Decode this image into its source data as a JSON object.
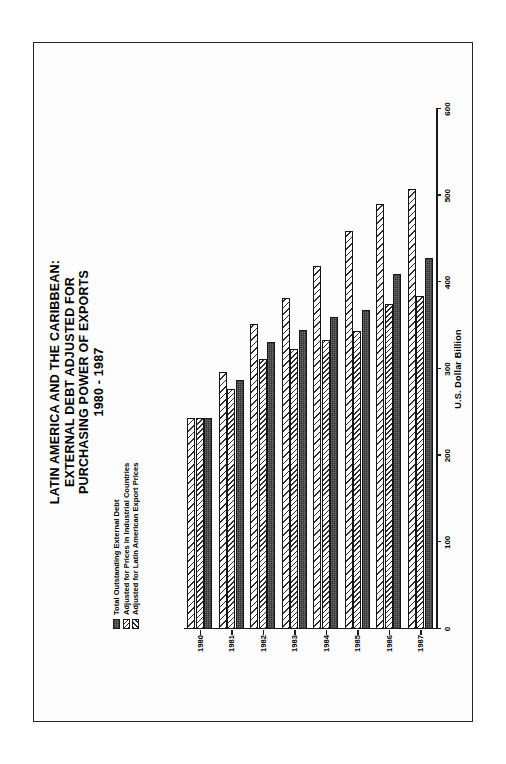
{
  "figure": {
    "title_lines": [
      "LATIN AMERICA AND THE CARIBBEAN:",
      "EXTERNAL DEBT ADJUSTED FOR",
      "PURCHASING POWER OF EXPORTS",
      "1980 - 1987"
    ]
  },
  "chart_data": {
    "type": "bar",
    "orientation": "horizontal",
    "title": "LATIN AMERICA AND THE CARIBBEAN: EXTERNAL DEBT ADJUSTED FOR PURCHASING POWER OF EXPORTS 1980 - 1987",
    "xlabel": "U.S. Dollar Billion",
    "ylabel": "",
    "categories": [
      "1980",
      "1981",
      "1982",
      "1983",
      "1984",
      "1985",
      "1986",
      "1987"
    ],
    "series": [
      {
        "name": "Total Outstanding External Debt",
        "pattern": "solid-gray",
        "values": [
          243,
          287,
          331,
          345,
          360,
          368,
          410,
          428
        ]
      },
      {
        "name": "Adjusted for Prices in Industrial Countries",
        "pattern": "dense-diagonal-hatch",
        "values": [
          243,
          277,
          311,
          323,
          334,
          344,
          375,
          384
        ]
      },
      {
        "name": "Adjusted for Latin American Export Prices",
        "pattern": "sparse-diagonal-hatch",
        "values": [
          243,
          297,
          352,
          382,
          419,
          459,
          490,
          508
        ]
      }
    ],
    "axis_ticks": [
      0,
      100,
      200,
      300,
      400,
      500,
      600
    ],
    "xlim": [
      0,
      600
    ],
    "grid": false,
    "legend_position": "upper-left"
  },
  "legend": {
    "items": [
      {
        "label": "Total Outstanding External Debt",
        "swatch": "sw-solid"
      },
      {
        "label": "Adjusted for Prices in Industrial Countries",
        "swatch": "sw-hatch-a"
      },
      {
        "label": "Adjusted for Latin American Export Prices",
        "swatch": "sw-hatch-b"
      }
    ]
  },
  "colors": {
    "ink": "#1a1a1a",
    "bar_solid": "#6e6e6e",
    "page": "#ffffff"
  }
}
